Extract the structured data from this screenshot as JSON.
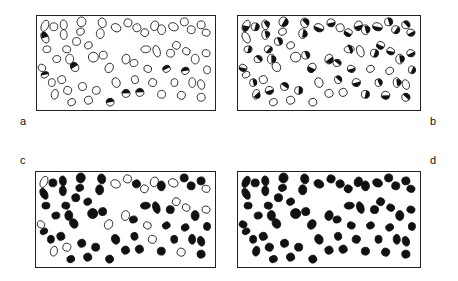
{
  "figure": {
    "panels": [
      {
        "id": "a",
        "label": "a",
        "fill_mode": "open",
        "box": {
          "x": 36,
          "y": 15,
          "w": 180,
          "h": 96
        },
        "label_pos": {
          "x": 20,
          "y": 116
        }
      },
      {
        "id": "b",
        "label": "b",
        "fill_mode": "partial",
        "box": {
          "x": 237,
          "y": 15,
          "w": 184,
          "h": 96
        },
        "label_pos": {
          "x": 430,
          "y": 116
        }
      },
      {
        "id": "c",
        "label": "c",
        "fill_mode": "mostly-filled",
        "box": {
          "x": 35,
          "y": 171,
          "w": 181,
          "h": 97
        },
        "label_pos": {
          "x": 20,
          "y": 155
        }
      },
      {
        "id": "d",
        "label": "d",
        "fill_mode": "filled",
        "box": {
          "x": 237,
          "y": 171,
          "w": 184,
          "h": 97
        },
        "label_pos": {
          "x": 430,
          "y": 155
        }
      }
    ],
    "colors": {
      "ink": "#111111",
      "background": "#ffffff"
    }
  }
}
